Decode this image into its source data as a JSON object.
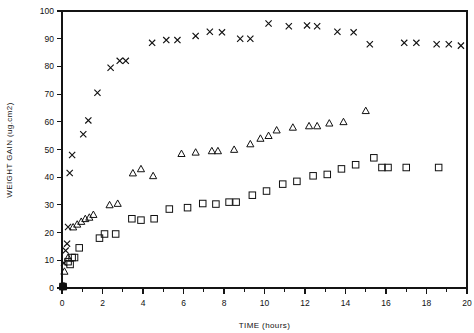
{
  "chart_data": {
    "type": "scatter",
    "title": "",
    "xlabel": "TIME (hours)",
    "ylabel": "WEIGHT GAIN  (ug.cm2)",
    "xlim": [
      0,
      20
    ],
    "ylim": [
      0,
      100
    ],
    "xticks": [
      0,
      1,
      2,
      3,
      4,
      5,
      6,
      7,
      8,
      9,
      10,
      11,
      12,
      13,
      14,
      15,
      16,
      17,
      18,
      19,
      20
    ],
    "xtick_labels": [
      "0",
      "",
      "2",
      "",
      "4",
      "",
      "6",
      "",
      "8",
      "",
      "10",
      "",
      "12",
      "",
      "14",
      "",
      "16",
      "",
      "18",
      "",
      "20"
    ],
    "yticks": [
      0,
      10,
      20,
      30,
      40,
      50,
      60,
      70,
      80,
      90,
      100
    ],
    "ytick_labels": [
      "0",
      "10",
      "20",
      "30",
      "40",
      "50",
      "60",
      "70",
      "80",
      "90",
      "100"
    ],
    "grid": false,
    "legend": "none",
    "series": [
      {
        "name": "series-x",
        "marker": "x",
        "points": [
          [
            0.05,
            0.5
          ],
          [
            0.1,
            9.0
          ],
          [
            0.18,
            13.5
          ],
          [
            0.25,
            16.0
          ],
          [
            0.3,
            22.0
          ],
          [
            0.38,
            41.5
          ],
          [
            0.5,
            48.0
          ],
          [
            1.05,
            55.5
          ],
          [
            1.3,
            60.5
          ],
          [
            1.75,
            70.5
          ],
          [
            2.4,
            79.5
          ],
          [
            2.85,
            82.0
          ],
          [
            3.15,
            82.0
          ],
          [
            4.45,
            88.5
          ],
          [
            5.15,
            89.5
          ],
          [
            5.7,
            89.5
          ],
          [
            6.6,
            91.0
          ],
          [
            7.3,
            92.5
          ],
          [
            7.9,
            92.3
          ],
          [
            8.8,
            90.0
          ],
          [
            9.3,
            90.0
          ],
          [
            10.2,
            95.5
          ],
          [
            11.2,
            94.5
          ],
          [
            12.1,
            94.8
          ],
          [
            12.6,
            94.5
          ],
          [
            13.6,
            92.5
          ],
          [
            14.4,
            92.3
          ],
          [
            15.2,
            88.0
          ],
          [
            16.9,
            88.5
          ],
          [
            17.5,
            88.5
          ],
          [
            18.5,
            88.0
          ],
          [
            19.1,
            88.0
          ],
          [
            19.7,
            87.5
          ]
        ]
      },
      {
        "name": "series-triangle",
        "marker": "triangle",
        "points": [
          [
            0.05,
            0.5
          ],
          [
            0.12,
            6.0
          ],
          [
            0.3,
            11.0
          ],
          [
            0.55,
            22.0
          ],
          [
            0.75,
            23.0
          ],
          [
            0.95,
            24.0
          ],
          [
            1.15,
            25.0
          ],
          [
            1.35,
            25.5
          ],
          [
            1.55,
            26.5
          ],
          [
            2.35,
            30.0
          ],
          [
            2.75,
            30.5
          ],
          [
            3.5,
            41.5
          ],
          [
            3.9,
            43.0
          ],
          [
            4.5,
            40.5
          ],
          [
            5.9,
            48.5
          ],
          [
            6.6,
            49.0
          ],
          [
            7.4,
            49.5
          ],
          [
            7.7,
            49.5
          ],
          [
            8.5,
            50.0
          ],
          [
            9.3,
            52.0
          ],
          [
            9.8,
            54.0
          ],
          [
            10.2,
            55.0
          ],
          [
            10.6,
            57.0
          ],
          [
            11.4,
            58.0
          ],
          [
            12.2,
            58.5
          ],
          [
            12.6,
            58.5
          ],
          [
            13.2,
            59.5
          ],
          [
            13.9,
            60.0
          ],
          [
            15.0,
            64.0
          ]
        ]
      },
      {
        "name": "series-square",
        "marker": "square",
        "points": [
          [
            0.05,
            0.5
          ],
          [
            0.3,
            9.5
          ],
          [
            0.4,
            8.5
          ],
          [
            0.5,
            11.0
          ],
          [
            0.62,
            11.0
          ],
          [
            0.85,
            14.5
          ],
          [
            1.85,
            18.0
          ],
          [
            2.1,
            19.5
          ],
          [
            2.65,
            19.5
          ],
          [
            3.45,
            25.0
          ],
          [
            3.9,
            24.5
          ],
          [
            4.55,
            25.0
          ],
          [
            5.3,
            28.5
          ],
          [
            6.2,
            29.0
          ],
          [
            6.95,
            30.5
          ],
          [
            7.6,
            30.3
          ],
          [
            8.25,
            31.0
          ],
          [
            8.6,
            31.0
          ],
          [
            9.4,
            33.5
          ],
          [
            10.1,
            35.0
          ],
          [
            10.9,
            37.5
          ],
          [
            11.6,
            38.5
          ],
          [
            12.4,
            40.5
          ],
          [
            13.1,
            41.0
          ],
          [
            13.8,
            43.0
          ],
          [
            14.5,
            44.5
          ],
          [
            15.4,
            47.0
          ],
          [
            15.8,
            43.5
          ],
          [
            16.1,
            43.5
          ],
          [
            17.0,
            43.5
          ],
          [
            18.6,
            43.5
          ]
        ]
      }
    ]
  }
}
